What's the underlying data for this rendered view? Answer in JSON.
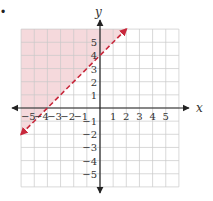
{
  "chart_data": {
    "type": "line",
    "title": "",
    "xlabel": "x",
    "ylabel": "y",
    "xlim": [
      -6,
      6
    ],
    "ylim": [
      -6,
      6
    ],
    "grid": true,
    "x_ticks": [
      -5,
      -4,
      -3,
      -2,
      -1,
      1,
      2,
      3,
      4,
      5
    ],
    "y_ticks": [
      -5,
      -4,
      -3,
      -2,
      -1,
      1,
      2,
      3,
      4,
      5
    ],
    "x_tick_labels": [
      "−5",
      "−4",
      "−3",
      "−2",
      "−1",
      "1",
      "2",
      "3",
      "4",
      "5"
    ],
    "y_tick_labels": [
      "−5",
      "−4",
      "−3",
      "−2",
      "−1",
      "1",
      "2",
      "3",
      "4",
      "5"
    ],
    "series": [
      {
        "name": "boundary y = x + 4",
        "style": "dashed",
        "arrows": "both",
        "color": "#c8283c",
        "x": [
          -6,
          2
        ],
        "y": [
          -2,
          6
        ]
      }
    ],
    "shaded_region": {
      "inequality": "y > x + 4",
      "side": "above-left",
      "color": "#f5d9dc"
    },
    "legend": null
  },
  "bullet": "•",
  "colors": {
    "line": "#c8283c",
    "shade": "#f5d9dc",
    "grid": "#c9c9c9",
    "axis": "#222222"
  }
}
